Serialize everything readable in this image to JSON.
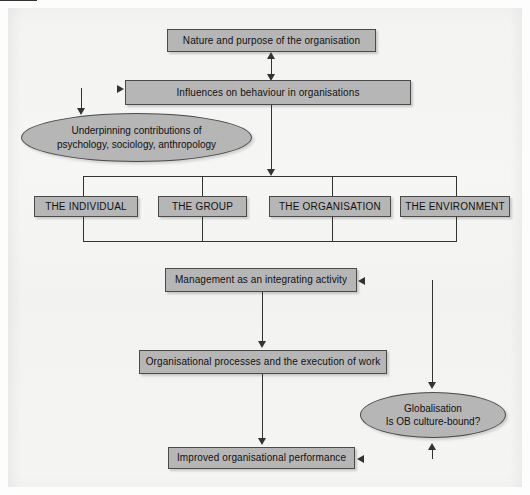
{
  "diagram": {
    "background_color": "#f4f4f3",
    "node_fill_color": "#b6b6b6",
    "node_border_color": "#4a4a4a",
    "connector_color": "#333333",
    "nodes": {
      "nature_purpose": "Nature and purpose of the organisation",
      "influences": "Influences on behaviour in organisations",
      "underpinning_line1": "Underpinning contributions of",
      "underpinning_line2": "psychology, sociology, anthropology",
      "the_individual": "THE INDIVIDUAL",
      "the_group": "THE GROUP",
      "the_organisation": "THE ORGANISATION",
      "the_environment": "THE ENVIRONMENT",
      "management": "Management as an integrating activity",
      "processes": "Organisational processes and the execution of work",
      "globalisation_line1": "Globalisation",
      "globalisation_line2": "Is OB culture-bound?",
      "improved_performance": "Improved organisational performance"
    }
  }
}
